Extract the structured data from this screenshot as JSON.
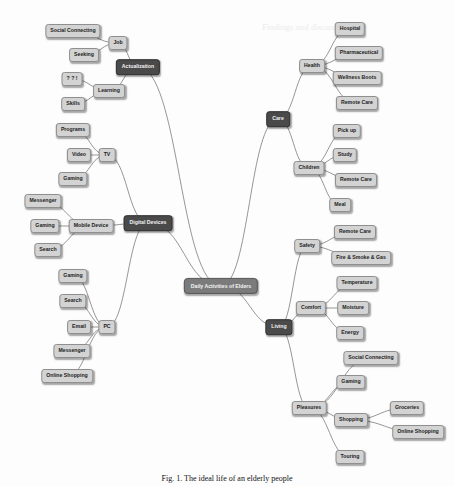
{
  "diagram": {
    "type": "mind-map",
    "center": {
      "id": "root",
      "label": "Daily Activities of Elders",
      "x": 221,
      "y": 286
    },
    "branches": [
      {
        "id": "actualization",
        "label": "Actualization",
        "x": 138,
        "y": 67,
        "parent": "root",
        "style": "dark"
      },
      {
        "id": "job",
        "label": "Job",
        "x": 118,
        "y": 43,
        "parent": "actualization"
      },
      {
        "id": "social_connecting_1",
        "label": "Social Connecting",
        "x": 73,
        "y": 31,
        "parent": "job"
      },
      {
        "id": "seeking",
        "label": "Seeking",
        "x": 84,
        "y": 55,
        "parent": "job"
      },
      {
        "id": "learning",
        "label": "Learning",
        "x": 109,
        "y": 91,
        "parent": "actualization"
      },
      {
        "id": "unreadable",
        "label": "? ? !",
        "x": 72,
        "y": 79,
        "parent": "learning"
      },
      {
        "id": "skills",
        "label": "Skills",
        "x": 73,
        "y": 104,
        "parent": "learning"
      },
      {
        "id": "digital_devices",
        "label": "Digital Devices",
        "x": 148,
        "y": 223,
        "parent": "root",
        "style": "dark"
      },
      {
        "id": "tv",
        "label": "TV",
        "x": 107,
        "y": 155,
        "parent": "digital_devices"
      },
      {
        "id": "programs",
        "label": "Programs",
        "x": 73,
        "y": 130,
        "parent": "tv"
      },
      {
        "id": "video",
        "label": "Video",
        "x": 79,
        "y": 155,
        "parent": "tv"
      },
      {
        "id": "gaming_tv",
        "label": "Gaming",
        "x": 73,
        "y": 179,
        "parent": "tv"
      },
      {
        "id": "mobile_device",
        "label": "Mobile Device",
        "x": 91,
        "y": 226,
        "parent": "digital_devices"
      },
      {
        "id": "messenger_1",
        "label": "Messenger",
        "x": 43,
        "y": 201,
        "parent": "mobile_device"
      },
      {
        "id": "gaming_mobile",
        "label": "Gaming",
        "x": 45,
        "y": 226,
        "parent": "mobile_device"
      },
      {
        "id": "search_1",
        "label": "Search",
        "x": 48,
        "y": 250,
        "parent": "mobile_device"
      },
      {
        "id": "pc",
        "label": "PC",
        "x": 107,
        "y": 327,
        "parent": "digital_devices"
      },
      {
        "id": "gaming_pc",
        "label": "Gaming",
        "x": 73,
        "y": 276,
        "parent": "pc"
      },
      {
        "id": "search_2",
        "label": "Search",
        "x": 73,
        "y": 301,
        "parent": "pc"
      },
      {
        "id": "email",
        "label": "Email",
        "x": 79,
        "y": 327,
        "parent": "pc"
      },
      {
        "id": "messenger_2",
        "label": "Messenger",
        "x": 72,
        "y": 351,
        "parent": "pc"
      },
      {
        "id": "online_shopping_1",
        "label": "Online Shopping",
        "x": 67,
        "y": 376,
        "parent": "pc"
      },
      {
        "id": "care",
        "label": "Care",
        "x": 278,
        "y": 119,
        "parent": "root",
        "style": "dark"
      },
      {
        "id": "health",
        "label": "Health",
        "x": 312,
        "y": 66,
        "parent": "care"
      },
      {
        "id": "hospital",
        "label": "Hospital",
        "x": 350,
        "y": 29,
        "parent": "health"
      },
      {
        "id": "pharmaceutical",
        "label": "Pharmaceutical",
        "x": 359,
        "y": 53,
        "parent": "health"
      },
      {
        "id": "wellness_boots",
        "label": "Wellness Boots",
        "x": 357,
        "y": 78,
        "parent": "health"
      },
      {
        "id": "remote_care_1",
        "label": "Remote Care",
        "x": 357,
        "y": 103,
        "parent": "health"
      },
      {
        "id": "children",
        "label": "Children",
        "x": 309,
        "y": 168,
        "parent": "care"
      },
      {
        "id": "pick_up",
        "label": "Pick up",
        "x": 347,
        "y": 131,
        "parent": "children"
      },
      {
        "id": "study",
        "label": "Study",
        "x": 345,
        "y": 155,
        "parent": "children"
      },
      {
        "id": "remote_care_2",
        "label": "Remote Care",
        "x": 356,
        "y": 180,
        "parent": "children"
      },
      {
        "id": "meal",
        "label": "Meal",
        "x": 340,
        "y": 205,
        "parent": "children"
      },
      {
        "id": "living",
        "label": "Living",
        "x": 279,
        "y": 327,
        "parent": "root",
        "style": "dark"
      },
      {
        "id": "safety",
        "label": "Safety",
        "x": 307,
        "y": 246,
        "parent": "living"
      },
      {
        "id": "remote_care_3",
        "label": "Remote Care",
        "x": 355,
        "y": 232,
        "parent": "safety"
      },
      {
        "id": "fire_smoke_gas",
        "label": "Fire & Smoke & Gas",
        "x": 361,
        "y": 258,
        "parent": "safety"
      },
      {
        "id": "comfort",
        "label": "Comfort",
        "x": 311,
        "y": 308,
        "parent": "living"
      },
      {
        "id": "temperature",
        "label": "Temperature",
        "x": 357,
        "y": 283,
        "parent": "comfort"
      },
      {
        "id": "moisture",
        "label": "Moisture",
        "x": 353,
        "y": 308,
        "parent": "comfort"
      },
      {
        "id": "energy",
        "label": "Energy",
        "x": 350,
        "y": 333,
        "parent": "comfort"
      },
      {
        "id": "pleasures",
        "label": "Pleasures",
        "x": 309,
        "y": 408,
        "parent": "living"
      },
      {
        "id": "social_connecting_2",
        "label": "Social Connecting",
        "x": 371,
        "y": 358,
        "parent": "pleasures"
      },
      {
        "id": "gaming_living",
        "label": "Gaming",
        "x": 351,
        "y": 382,
        "parent": "pleasures"
      },
      {
        "id": "shopping",
        "label": "Shopping",
        "x": 351,
        "y": 420,
        "parent": "pleasures"
      },
      {
        "id": "groceries",
        "label": "Groceries",
        "x": 407,
        "y": 408,
        "parent": "shopping"
      },
      {
        "id": "online_shopping_2",
        "label": "Online Shopping",
        "x": 418,
        "y": 432,
        "parent": "shopping"
      },
      {
        "id": "touring",
        "label": "Touring",
        "x": 350,
        "y": 457,
        "parent": "pleasures"
      }
    ]
  },
  "caption": "Fig. 1. The ideal life of an elderly people",
  "colors": {
    "leaf_fill": "#d3d3d3",
    "dark_fill": "#4a4a4a",
    "center_fill": "#7b7b7b",
    "link": "#6a6a6a"
  }
}
